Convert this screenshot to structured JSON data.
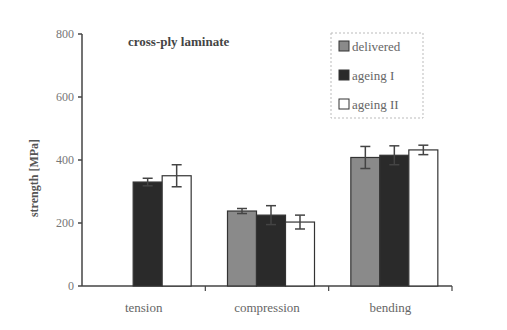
{
  "chart_data": {
    "type": "bar",
    "title": "cross-ply laminate",
    "xlabel": "",
    "ylabel": "strength [MPa]",
    "ylim": [
      0,
      800
    ],
    "yticks": [
      0,
      200,
      400,
      600,
      800
    ],
    "grid": false,
    "legend_position": "upper-right",
    "categories": [
      "tension",
      "compression",
      "bending"
    ],
    "series": [
      {
        "name": "delivered",
        "color": "#8a8a8a",
        "values": [
          null,
          238,
          408
        ],
        "errors": [
          null,
          8,
          35
        ]
      },
      {
        "name": "ageing I",
        "color": "#2a2a2a",
        "values": [
          330,
          225,
          415
        ],
        "errors": [
          12,
          30,
          30
        ]
      },
      {
        "name": "ageing II",
        "color": "#ffffff",
        "values": [
          350,
          203,
          432
        ],
        "errors": [
          35,
          22,
          15
        ]
      }
    ]
  },
  "labels": {
    "title": "cross-ply laminate",
    "ylabel": "strength [MPa]",
    "legend": [
      "delivered",
      "ageing I",
      "ageing II"
    ],
    "categories": [
      "tension",
      "compression",
      "bending"
    ],
    "yticks": [
      "0",
      "200",
      "400",
      "600",
      "800"
    ]
  }
}
